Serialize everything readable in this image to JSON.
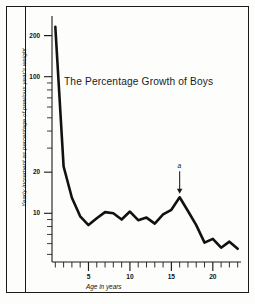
{
  "figure": {
    "title": "The Percentage Growth of Boys",
    "x_caption": "Age in years",
    "y_caption": "Yearly increment as percentage of previous year's weight",
    "annotation_label": "a",
    "line_color": "#111111",
    "background_color": "#fdfdfb",
    "frame_color": "#1a1a1a"
  },
  "ticks": {
    "y": [
      {
        "value": 200,
        "label": "200"
      },
      {
        "value": 100,
        "label": "100"
      },
      {
        "value": 20,
        "label": "20"
      },
      {
        "value": 10,
        "label": "10"
      }
    ],
    "x": [
      {
        "value": 5,
        "label": "5"
      },
      {
        "value": 10,
        "label": "10"
      },
      {
        "value": 15,
        "label": "15"
      },
      {
        "value": 20,
        "label": "20"
      }
    ]
  },
  "chart_data": {
    "type": "line",
    "title": "The Percentage Growth of Boys",
    "xlabel": "Age in years",
    "ylabel": "Yearly increment as percentage of previous year's weight",
    "yscale": "log",
    "xlim": [
      0.6,
      23.4
    ],
    "ylim": [
      4.4,
      260
    ],
    "grid": false,
    "legend": false,
    "xticks": [
      5,
      10,
      15,
      20
    ],
    "yticks": [
      200,
      100,
      20,
      10
    ],
    "x": [
      1,
      2,
      3,
      4,
      5,
      6,
      7,
      8,
      9,
      10,
      11,
      12,
      13,
      14,
      15,
      16,
      17,
      18,
      19,
      20,
      21,
      22,
      23
    ],
    "values": [
      232,
      22,
      13,
      9.5,
      8.2,
      9.2,
      10.2,
      10.0,
      9.0,
      10.3,
      8.9,
      9.3,
      8.4,
      9.8,
      10.6,
      13.1,
      10.4,
      8.2,
      6.1,
      6.5,
      5.6,
      6.2,
      5.5
    ],
    "series": [
      {
        "name": "Yearly weight increment (%)",
        "values": [
          232,
          22,
          13,
          9.5,
          8.2,
          9.2,
          10.2,
          10.0,
          9.0,
          10.3,
          8.9,
          9.3,
          8.4,
          9.8,
          10.6,
          13.1,
          10.4,
          8.2,
          6.1,
          6.5,
          5.6,
          6.2,
          5.5
        ]
      }
    ],
    "annotations": [
      {
        "label": "a",
        "x": 16,
        "y": 13.1,
        "type": "arrow-down",
        "note": "adolescent growth spurt peak"
      }
    ]
  }
}
